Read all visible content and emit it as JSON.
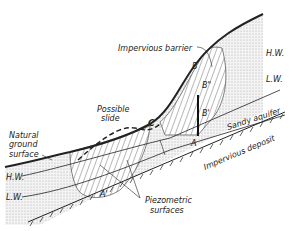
{
  "diagram": {
    "type": "geologic cross-section",
    "labels": {
      "impervious_barrier": "Impervious barrier",
      "possible_slide": [
        "Possible",
        "slide"
      ],
      "natural_ground_surface": [
        "Natural",
        "ground",
        "surface"
      ],
      "sandy_aquifer": "Sandy aquifer",
      "impervious_deposit": "Impervious deposit",
      "piezometric_surfaces": [
        "Piezometric",
        "surfaces"
      ],
      "hw_left": "H.W.",
      "lw_left": "L.W.",
      "hw_right": "H.W.",
      "lw_right": "L.W.",
      "point_b": "B",
      "point_b2": "B\"",
      "point_b1": "B'",
      "point_a": "A",
      "point_a1": "A'",
      "point_c": "C"
    },
    "colors": {
      "ink": "#222222",
      "stipple": "#d9d9d9",
      "background": "#ffffff"
    }
  }
}
